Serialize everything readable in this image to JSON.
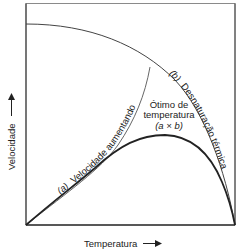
{
  "diagram": {
    "type": "enzyme temperature curve",
    "axes": {
      "x_label": "Temperatura",
      "y_label": "Velocidade",
      "x_arrow": "→",
      "y_arrow": "↑"
    },
    "curves": [
      {
        "id": "a",
        "label": "(a) Velocidade aumentando",
        "description": "rising rate with temperature"
      },
      {
        "id": "b",
        "label": "(b) Desnaturação térmica",
        "description": "thermal denaturation falloff"
      },
      {
        "id": "axb",
        "label": "Ótimo de temperatura (a × b)",
        "description": "combined optimum curve"
      }
    ],
    "labels": {
      "curve_a_prefix": "(a)",
      "curve_a_text": "Velocidade aumentando",
      "curve_b_prefix": "(b)",
      "curve_b_text": "Desnaturação térmica",
      "optimum_line1": "Ótimo de",
      "optimum_line2": "temperatura",
      "optimum_line3": "(a × b)"
    },
    "colors": {
      "line": "#333333",
      "text": "#222222",
      "background": "#ffffff"
    }
  }
}
